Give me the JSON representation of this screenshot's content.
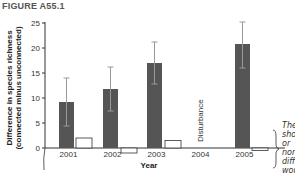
{
  "figure": {
    "title": "FIGURE A55.1",
    "annotation": "Disturbance",
    "side_note_lines": [
      "The",
      "sho",
      "or",
      "non",
      "diff",
      "wou"
    ]
  },
  "colors": {
    "bar": "#555555",
    "error_bar": "#999999",
    "axis": "#333333",
    "control_box_fill": "#ffffff",
    "control_box_stroke": "#333333"
  },
  "chart_data": {
    "type": "bar",
    "title": "FIGURE A55.1",
    "xlabel": "Year",
    "ylabel": "Difference in species richness (connected minus unconnected)",
    "ylim": [
      0,
      25
    ],
    "yticks": [
      0,
      5,
      10,
      15,
      20,
      25
    ],
    "categories": [
      "2001",
      "2002",
      "2003",
      "2004",
      "2005"
    ],
    "series": [
      {
        "name": "Difference (mean)",
        "values": [
          9.2,
          11.8,
          17.0,
          null,
          20.8
        ],
        "error_low": [
          4.4,
          7.4,
          12.8,
          null,
          16.0
        ],
        "error_high": [
          14.0,
          16.2,
          21.2,
          null,
          25.2
        ]
      },
      {
        "name": "Control (open boxes)",
        "values": [
          2.0,
          -1.0,
          1.5,
          null,
          -0.5
        ]
      }
    ],
    "annotations": [
      {
        "category": "2004",
        "text": "Disturbance",
        "rotation": -90
      }
    ],
    "grid": false,
    "legend": "none"
  }
}
